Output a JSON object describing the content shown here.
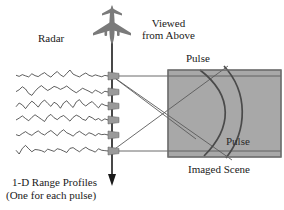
{
  "figure": {
    "title_labels": {
      "radar": "Radar",
      "viewed_from_above_line1": "Viewed",
      "viewed_from_above_line2": "from Above",
      "pulse_top": "Pulse",
      "pulse_inside": "Pulse",
      "imaged_scene": "Imaged Scene",
      "range_profiles_line1": "1-D Range Profiles",
      "range_profiles_line2": "(One for each pulse)"
    },
    "colors": {
      "scene_fill": "#a8a8a8",
      "scene_stroke": "#6f6f6f",
      "arc_stroke": "#4a4a4a",
      "beam_stroke": "#555555",
      "aircraft_fill": "#7a7a7a",
      "flightpath_stroke": "#1a1a1a",
      "waveform_stroke": "#1a1a1a",
      "marker_fill": "#9a9a9a",
      "text": "#1a1a1a",
      "background": "#ffffff"
    },
    "geometry": {
      "flight_path_x": 112,
      "flight_path_y_top": 40,
      "flight_path_y_bottom": 185,
      "scene_rect": {
        "x": 168,
        "y": 70,
        "width": 113,
        "height": 87
      },
      "pulse_count": 6,
      "pulse_y_positions": [
        76,
        92,
        106,
        120,
        135,
        151
      ]
    }
  },
  "chart_data": {
    "type": "line",
    "title": "1-D Range Profiles",
    "xlabel": "",
    "ylabel": "",
    "series": [
      {
        "name": "pulse-1",
        "y": 76,
        "values": [
          0.1,
          -0.05,
          0.18,
          0.02,
          -0.12,
          0.3,
          0.05,
          -0.08,
          0.22,
          0.45,
          0.1,
          -0.15,
          0.28,
          0.6,
          0.15,
          -0.1,
          0.35,
          0.8,
          0.25,
          0.05,
          -0.12,
          0.18,
          0.4,
          0.1,
          -0.05,
          0.15,
          0.02,
          -0.1,
          0.08,
          0.0
        ]
      },
      {
        "name": "pulse-2",
        "y": 92,
        "values": [
          0.05,
          0.3,
          0.7,
          0.4,
          -0.2,
          -0.45,
          0.1,
          0.55,
          0.85,
          0.5,
          0.2,
          0.45,
          0.75,
          0.6,
          0.35,
          0.55,
          0.8,
          0.45,
          0.15,
          -0.1,
          0.2,
          0.5,
          0.3,
          0.1,
          -0.15,
          0.25,
          0.05,
          -0.2,
          0.1,
          0.0
        ]
      },
      {
        "name": "pulse-3",
        "y": 106,
        "values": [
          -0.1,
          0.4,
          0.15,
          -0.35,
          0.2,
          0.65,
          0.3,
          -0.15,
          0.45,
          0.8,
          0.35,
          -0.05,
          0.5,
          0.25,
          -0.3,
          0.4,
          0.7,
          0.2,
          -0.2,
          0.55,
          0.85,
          0.3,
          0.0,
          0.35,
          0.6,
          0.15,
          -0.25,
          0.3,
          0.1,
          0.0
        ]
      },
      {
        "name": "pulse-4",
        "y": 120,
        "values": [
          0.0,
          0.25,
          0.55,
          0.2,
          -0.1,
          0.35,
          0.7,
          0.4,
          0.1,
          -0.2,
          0.45,
          0.75,
          0.3,
          0.05,
          0.4,
          0.6,
          0.25,
          -0.15,
          0.35,
          0.65,
          0.45,
          0.1,
          -0.05,
          0.5,
          0.3,
          0.0,
          0.2,
          -0.1,
          0.15,
          0.0
        ]
      },
      {
        "name": "pulse-5",
        "y": 135,
        "values": [
          0.05,
          -0.1,
          0.2,
          0.45,
          0.15,
          -0.05,
          0.3,
          0.55,
          0.2,
          0.0,
          0.35,
          0.6,
          0.25,
          -0.1,
          0.4,
          0.7,
          0.3,
          0.1,
          -0.15,
          0.25,
          0.5,
          0.2,
          -0.05,
          0.3,
          0.15,
          -0.1,
          0.2,
          0.05,
          0.1,
          0.0
        ]
      },
      {
        "name": "pulse-6",
        "y": 151,
        "values": [
          0.1,
          -0.4,
          0.35,
          0.75,
          0.3,
          -0.1,
          0.2,
          0.15,
          0.05,
          -0.15,
          0.25,
          0.1,
          -0.05,
          0.3,
          0.2,
          0.0,
          -0.2,
          0.35,
          0.45,
          0.15,
          -0.1,
          0.25,
          0.5,
          0.2,
          0.05,
          -0.15,
          0.3,
          0.1,
          0.05,
          0.0
        ]
      }
    ],
    "x_start": 16,
    "x_end": 108,
    "amplitude": 7.5
  }
}
